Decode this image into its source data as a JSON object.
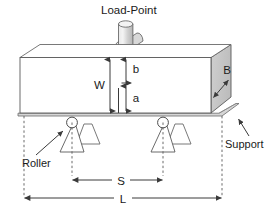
{
  "figure": {
    "type": "engineering-diagram",
    "background_color": "#ffffff",
    "line_color": "#4a4a4a",
    "text_color": "#1a1a1a",
    "shade_color": "#c8c8c8",
    "plate_color": "#d6d6d6"
  },
  "labels": {
    "load_point": "Load-Point",
    "width_W": "W",
    "dim_b": "b",
    "dim_a": "a",
    "depth_B": "B",
    "support": "Support",
    "roller": "Roller",
    "span_S": "S",
    "length_L": "L"
  },
  "parts": {
    "load_cylinder": "load-cylinder",
    "load_roller": "load-roller",
    "beam": "beam-specimen",
    "beam_end_face": "beam-end-face",
    "support_plate": "support-plate",
    "roller_left": "roller-left",
    "roller_right": "roller-right",
    "wedge_left": "wedge-left",
    "wedge_right": "wedge-right",
    "block_left": "block-left",
    "block_right": "block-right"
  },
  "dimensions": [
    {
      "symbol": "W",
      "meaning": "beam depth / width of specimen",
      "orientation": "vertical"
    },
    {
      "symbol": "b",
      "meaning": "upper notch segment",
      "orientation": "vertical"
    },
    {
      "symbol": "a",
      "meaning": "lower notch / crack length segment",
      "orientation": "vertical"
    },
    {
      "symbol": "B",
      "meaning": "beam breadth (end face)",
      "orientation": "diagonal"
    },
    {
      "symbol": "S",
      "meaning": "support span between rollers",
      "orientation": "horizontal"
    },
    {
      "symbol": "L",
      "meaning": "total beam length",
      "orientation": "horizontal"
    }
  ],
  "icons": {
    "arrow_up": "arrow-up-icon",
    "arrow_down": "arrow-down-icon",
    "arrow_left": "arrow-left-icon",
    "arrow_right": "arrow-right-icon",
    "pointer": "pointer-arrow-icon"
  }
}
